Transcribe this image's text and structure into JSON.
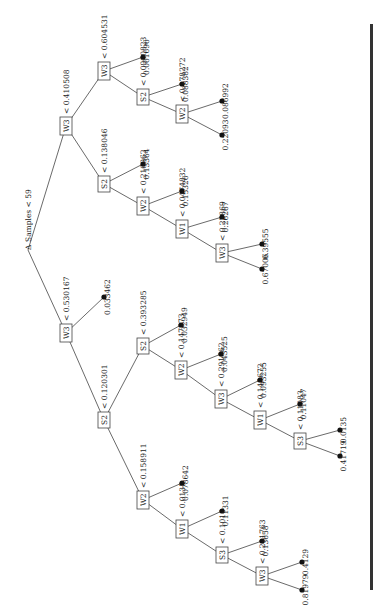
{
  "root": {
    "symbol": "Δ",
    "label": "Samples < 59"
  },
  "nodes": {
    "n_w3_0410508": {
      "var": "W3",
      "cond": "< 0.410508"
    },
    "n_w3_0604531": {
      "var": "W3",
      "cond": "< 0.604531"
    },
    "n_s2_0090": {
      "var": "S2",
      "cond": "< 0.0900823"
    },
    "n_w2_0172": {
      "var": "W2",
      "cond": "< 0.178272"
    },
    "n_s2_0138046": {
      "var": "S2",
      "cond": "< 0.138046"
    },
    "n_w2_02169": {
      "var": "W2",
      "cond": "< 0.216962"
    },
    "n_w1_0047": {
      "var": "W1",
      "cond": "< 0.0474832"
    },
    "n_w3_022": {
      "var": "W3",
      "cond": "< 0.22869"
    },
    "n_w3_0530167": {
      "var": "W3",
      "cond": "< 0.530167"
    },
    "n_s2_0120301": {
      "var": "S2",
      "cond": "< 0.120301"
    },
    "n_s2_0393285": {
      "var": "S2",
      "cond": "< 0.393285"
    },
    "n_w2_0147": {
      "var": "W2",
      "cond": "< 0.147273"
    },
    "n_w3_0291": {
      "var": "W3",
      "cond": "< 0.291662"
    },
    "n_w1_0145": {
      "var": "W1",
      "cond": "< 0.145672"
    },
    "n_s3_0110": {
      "var": "S3",
      "cond": "< 0.11083"
    },
    "n_w2_0158911": {
      "var": "W2",
      "cond": "< 0.158911"
    },
    "n_w1_00135": {
      "var": "W1",
      "cond": "< 0.0135"
    },
    "n_s3_01018": {
      "var": "S3",
      "cond": "< 0.1018"
    },
    "n_w3_0201": {
      "var": "W3",
      "cond": "< 0.201763"
    }
  },
  "leaves": {
    "l1": "0.061696",
    "l2": "0.088382",
    "l3": "0.086992",
    "l4": "0.22093",
    "l5": "0.13364",
    "l6": "0.15326",
    "l7": "0.26267",
    "l8": "0.39555",
    "l9": "0.67006",
    "l10": "0.033462",
    "l11": "0.032949",
    "l12": "0.043525",
    "l13": "0.093255",
    "l14": "0.11047",
    "l15": "0.0135",
    "l16": "0.41719",
    "l17": "0.078642",
    "l18": "0.11331",
    "l19": "0.13658",
    "l20": "0.4129",
    "l21": "0.81979"
  }
}
